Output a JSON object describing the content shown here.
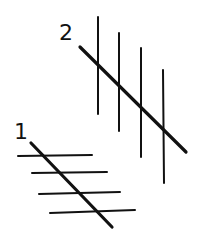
{
  "figure": {
    "stroke_color": "#111111",
    "labels": [
      {
        "text": "1",
        "x": 14,
        "y": 121
      },
      {
        "text": "2",
        "x": 59,
        "y": 22
      }
    ],
    "group_2": {
      "verticals": [
        {
          "x1": 98,
          "y1": 17,
          "x2": 98,
          "y2": 114
        },
        {
          "x1": 119,
          "y1": 33,
          "x2": 119,
          "y2": 131
        },
        {
          "x1": 141,
          "y1": 48,
          "x2": 141,
          "y2": 157
        },
        {
          "x1": 163,
          "y1": 70,
          "x2": 164,
          "y2": 183
        }
      ],
      "diagonal": {
        "x1": 80,
        "y1": 47,
        "x2": 186,
        "y2": 152
      }
    },
    "group_1": {
      "horizontals": [
        {
          "x1": 18,
          "y1": 156,
          "x2": 92,
          "y2": 155
        },
        {
          "x1": 32,
          "y1": 173,
          "x2": 107,
          "y2": 172
        },
        {
          "x1": 39,
          "y1": 194,
          "x2": 120,
          "y2": 192
        },
        {
          "x1": 50,
          "y1": 213,
          "x2": 135,
          "y2": 210
        }
      ],
      "diagonal": {
        "x1": 31,
        "y1": 143,
        "x2": 112,
        "y2": 227
      }
    }
  }
}
